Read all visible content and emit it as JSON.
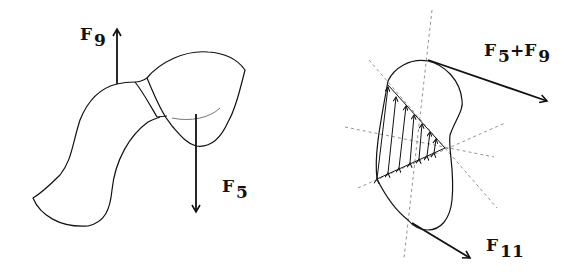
{
  "figure": {
    "left_panel": {
      "labels": {
        "f9": {
          "base": "F",
          "sub": "9"
        },
        "f5": {
          "base": "F",
          "sub": "5"
        }
      }
    },
    "right_panel": {
      "labels": {
        "f5_plus_f9": {
          "base1": "F",
          "sub1": "5",
          "plus": "+",
          "base2": "F",
          "sub2": "9"
        },
        "f11": {
          "base": "F",
          "sub": "11"
        }
      }
    },
    "colors": {
      "stroke": "#111111",
      "dashed": "#777777",
      "background": "#ffffff"
    }
  }
}
